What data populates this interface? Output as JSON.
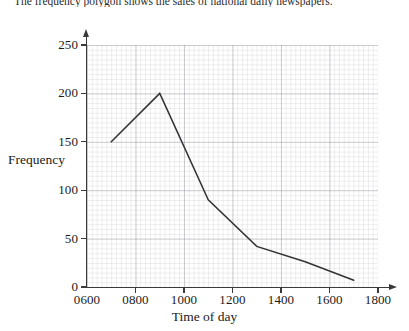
{
  "caption": {
    "text": "The frequency polygon shows the sales of national daily newspapers."
  },
  "axis_title_y": "Frequency",
  "axis_title_x": "Time of day",
  "chart_data": {
    "type": "line",
    "title": "",
    "xlabel": "Time of day",
    "ylabel": "Frequency",
    "x": [
      "0700",
      "0900",
      "1100",
      "1300",
      "1500",
      "1700"
    ],
    "x_numeric": [
      700,
      900,
      1100,
      1300,
      1500,
      1700
    ],
    "values": [
      150,
      200,
      90,
      42,
      26,
      7
    ],
    "series": [
      {
        "name": "Newspaper sales",
        "values": [
          150,
          200,
          90,
          42,
          26,
          7
        ]
      }
    ],
    "xlim": [
      600,
      1800
    ],
    "ylim": [
      0,
      250
    ],
    "xticks": [
      "0600",
      "0800",
      "1000",
      "1200",
      "1400",
      "1600",
      "1800"
    ],
    "xtick_values": [
      600,
      800,
      1000,
      1200,
      1400,
      1600,
      1800
    ],
    "yticks": [
      "0",
      "50",
      "100",
      "150",
      "200",
      "250"
    ],
    "ytick_values": [
      0,
      50,
      100,
      150,
      200,
      250
    ],
    "grid": true,
    "legend": "none",
    "line_color": "#333333"
  }
}
